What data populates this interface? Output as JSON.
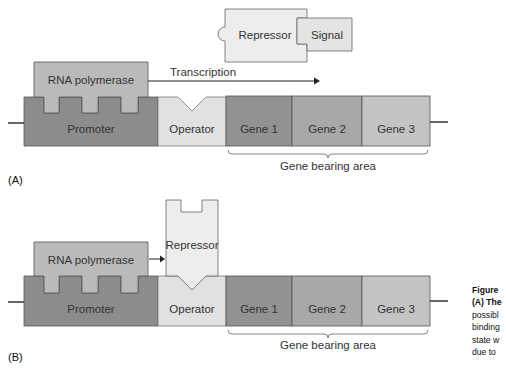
{
  "colors": {
    "promoter": "#8a8a8a",
    "rna_polymerase": "#b9b9b9",
    "operator": "#e2e2e2",
    "gene1": "#909090",
    "gene2": "#a7a7a7",
    "gene3": "#c4c4c4",
    "repressor": "#ececec",
    "signal": "#e4e4e4",
    "outline": "#555555"
  },
  "panel_a": {
    "label": "(A)",
    "repressor_label": "Repressor",
    "signal_label": "Signal",
    "rna_polymerase_label": "RNA polymerase",
    "transcription_label": "Transcription",
    "promoter_label": "Promoter",
    "operator_label": "Operator",
    "genes": [
      "Gene 1",
      "Gene 2",
      "Gene 3"
    ],
    "gene_area_label": "Gene bearing area"
  },
  "panel_b": {
    "label": "(B)",
    "repressor_label": "Repressor",
    "rna_polymerase_label": "RNA polymerase",
    "promoter_label": "Promoter",
    "operator_label": "Operator",
    "genes": [
      "Gene 1",
      "Gene 2",
      "Gene 3"
    ],
    "gene_area_label": "Gene bearing area"
  },
  "caption": {
    "title": "Figure",
    "lines": [
      "(A) The",
      "possibl",
      "binding",
      "state w",
      "due to"
    ]
  }
}
